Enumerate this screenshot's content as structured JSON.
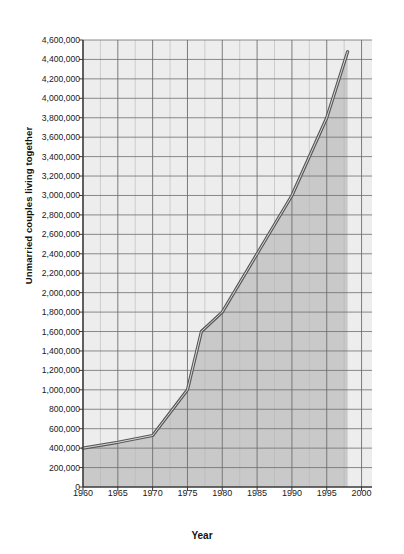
{
  "chart_data": {
    "type": "line",
    "title": "",
    "xlabel": "Year",
    "ylabel": "Unmarried couples living together",
    "xlim": [
      1960,
      2001.5
    ],
    "ylim": [
      0,
      4600000
    ],
    "ytick_step": 200000,
    "grid": true,
    "legend": "none",
    "area_fill": true,
    "xticks": [
      1960,
      1965,
      1970,
      1975,
      1980,
      1985,
      1990,
      1995,
      2000
    ],
    "xtick_labels": [
      "1960",
      "1965",
      "1970",
      "1975",
      "1980",
      "1985",
      "1990",
      "1995",
      "2000"
    ],
    "yticks": [
      0,
      200000,
      400000,
      600000,
      800000,
      1000000,
      1200000,
      1400000,
      1600000,
      1800000,
      2000000,
      2200000,
      2400000,
      2600000,
      2800000,
      3000000,
      3200000,
      3400000,
      3600000,
      3800000,
      4000000,
      4200000,
      4400000,
      4600000
    ],
    "ytick_labels": [
      "0",
      "200,000",
      "400,000",
      "600,000",
      "800,000",
      "1,000,000",
      "1,200,000",
      "1,400,000",
      "1,600,000",
      "1,800,000",
      "2,000,000",
      "2,200,000",
      "2,400,000",
      "2,600,000",
      "2,800,000",
      "3,000,000",
      "3,200,000",
      "3,400,000",
      "3,600,000",
      "3,800,000",
      "4,000,000",
      "4,200,000",
      "4,400,000",
      "4,600,000"
    ],
    "x": [
      1960,
      1965,
      1970,
      1975,
      1977,
      1980,
      1985,
      1990,
      1995,
      1998
    ],
    "values": [
      400000,
      460000,
      530000,
      1000000,
      1600000,
      1800000,
      2400000,
      3000000,
      3800000,
      4480000
    ],
    "series": [
      {
        "name": "Unmarried couples living together",
        "color": "#585858",
        "points": [
          {
            "year": 1960,
            "value": 400000
          },
          {
            "year": 1965,
            "value": 460000
          },
          {
            "year": 1970,
            "value": 530000
          },
          {
            "year": 1975,
            "value": 1000000
          },
          {
            "year": 1977,
            "value": 1600000
          },
          {
            "year": 1980,
            "value": 1800000
          },
          {
            "year": 1985,
            "value": 2400000
          },
          {
            "year": 1990,
            "value": 3000000
          },
          {
            "year": 1995,
            "value": 3800000
          },
          {
            "year": 1998,
            "value": 4480000
          }
        ]
      }
    ]
  },
  "colors": {
    "line": "#585858",
    "plot_background": "#ededed",
    "area_fill": "#c9c9c9",
    "grid_major": "#6e6e6e",
    "grid_minor": "#b5b5b5",
    "axis": "#3a3a3a",
    "text": "#1a1a1a",
    "page_background": "#ffffff"
  }
}
